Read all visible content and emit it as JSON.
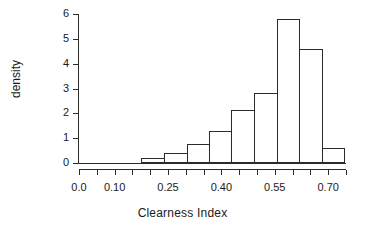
{
  "chart_data": {
    "type": "bar",
    "title": "",
    "xlabel": "Clearness Index",
    "ylabel": "density",
    "xlim": [
      0.0,
      0.75
    ],
    "ylim": [
      0,
      6
    ],
    "grid": false,
    "legend": null,
    "x_ticks": [
      {
        "value": 0.0,
        "label": "0.0"
      },
      {
        "value": 0.05,
        "label": ""
      },
      {
        "value": 0.1,
        "label": "0.10"
      },
      {
        "value": 0.15,
        "label": ""
      },
      {
        "value": 0.2,
        "label": ""
      },
      {
        "value": 0.25,
        "label": "0.25"
      },
      {
        "value": 0.3,
        "label": ""
      },
      {
        "value": 0.35,
        "label": ""
      },
      {
        "value": 0.4,
        "label": "0.40"
      },
      {
        "value": 0.45,
        "label": ""
      },
      {
        "value": 0.5,
        "label": ""
      },
      {
        "value": 0.55,
        "label": "0.55"
      },
      {
        "value": 0.6,
        "label": ""
      },
      {
        "value": 0.65,
        "label": ""
      },
      {
        "value": 0.7,
        "label": "0.70"
      },
      {
        "value": 0.75,
        "label": ""
      }
    ],
    "y_ticks": [
      {
        "value": 0,
        "label": "0"
      },
      {
        "value": 1,
        "label": "1"
      },
      {
        "value": 2,
        "label": "2"
      },
      {
        "value": 3,
        "label": "3"
      },
      {
        "value": 4,
        "label": "4"
      },
      {
        "value": 5,
        "label": "5"
      },
      {
        "value": 6,
        "label": "6"
      }
    ],
    "bin_edges": [
      0.175,
      0.238,
      0.302,
      0.365,
      0.428,
      0.492,
      0.555,
      0.618,
      0.682,
      0.745
    ],
    "categories": [
      "0.175-0.238",
      "0.238-0.302",
      "0.302-0.365",
      "0.365-0.428",
      "0.428-0.492",
      "0.492-0.555",
      "0.555-0.618",
      "0.618-0.682",
      "0.682-0.745"
    ],
    "values": [
      0.22,
      0.4,
      0.78,
      1.3,
      2.15,
      2.8,
      5.8,
      4.6,
      0.62
    ],
    "series": [
      {
        "name": "density",
        "values": [
          0.22,
          0.4,
          0.78,
          1.3,
          2.15,
          2.8,
          5.8,
          4.6,
          0.62
        ]
      }
    ],
    "bar_fill": "#ffffff",
    "bar_stroke": "#2b2b2b",
    "axis_color": "#2b2b2b",
    "text_color": "#1a1a1a",
    "background": "#ffffff"
  }
}
